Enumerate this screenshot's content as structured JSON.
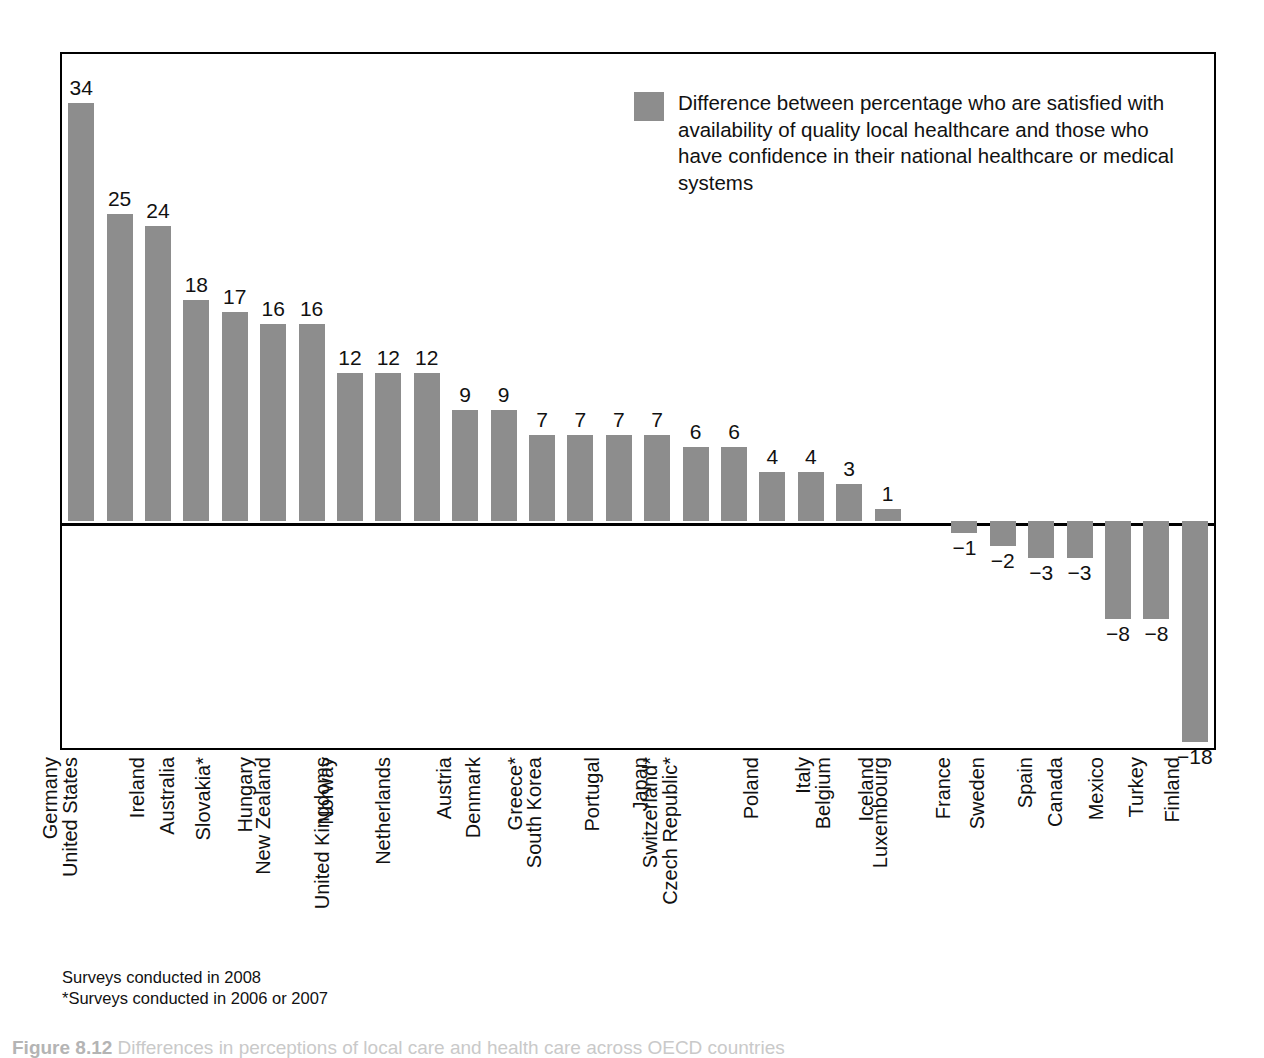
{
  "legend": {
    "swatch_color": "#8d8d8d",
    "text": "Difference between percentage who are satisfied with availability of quality local healthcare and those who have confidence in their national healthcare or medical systems"
  },
  "footnotes": {
    "line1": "Surveys conducted in 2008",
    "line2": "*Surveys conducted in 2006 or 2007"
  },
  "caption": {
    "figure_number": "Figure 8.12",
    "text": "Differences in perceptions of local care and health care across OECD countries"
  },
  "chart_data": {
    "type": "bar",
    "title": "",
    "subtitle": "",
    "xlabel": "",
    "ylabel": "",
    "grid": false,
    "legend_position": "top-right",
    "series_name": "Difference between percentage who are satisfied with availability of quality local healthcare and those who have confidence in their national healthcare or medical systems",
    "bar_color": "#8d8d8d",
    "ylim": [
      -22,
      38
    ],
    "zero_line": 0,
    "categories": [
      "Germany",
      "United States",
      "Ireland",
      "Australia",
      "Slovakia*",
      "Hungary",
      "New Zealand",
      "Norway",
      "United Kingdoms",
      "Netherlands",
      "Austria",
      "Denmark",
      "Greece*",
      "South Korea",
      "Portugal",
      "Japan",
      "Switzerland*",
      "Czech Republic*",
      "Poland",
      "Italy",
      "Belgium",
      "Iceland",
      "Luxembourg",
      "France",
      "Sweden",
      "Spain",
      "Canada",
      "Mexico",
      "Turkey",
      "Finland"
    ],
    "values": [
      34,
      25,
      24,
      18,
      17,
      16,
      16,
      12,
      12,
      12,
      9,
      9,
      7,
      7,
      7,
      7,
      6,
      6,
      4,
      4,
      3,
      1,
      0,
      -1,
      -2,
      -3,
      -3,
      -8,
      -8,
      -18
    ],
    "value_labels": [
      "34",
      "25",
      "24",
      "18",
      "17",
      "16",
      "16",
      "12",
      "12",
      "12",
      "9",
      "9",
      "7",
      "7",
      "7",
      "7",
      "6",
      "6",
      "4",
      "4",
      "3",
      "1",
      "",
      "−1",
      "−2",
      "−3",
      "−3",
      "−8",
      "−8",
      "−18"
    ]
  }
}
